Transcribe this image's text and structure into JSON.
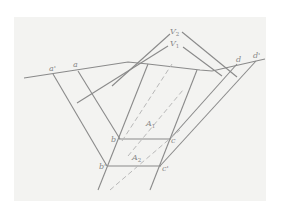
{
  "diagram": {
    "type": "geometric-construction",
    "labels": {
      "a_prime": "a'",
      "a": "a",
      "d": "d",
      "d_prime": "d'",
      "b": "b",
      "c": "c",
      "b_prime": "b'",
      "c_prime": "c'",
      "V1": "V",
      "V1_sub": "1",
      "V2": "V",
      "V2_sub": "2",
      "A1": "A",
      "A1_sub": "1",
      "A2": "A",
      "A2_sub": "2"
    },
    "colors": {
      "background": "#f3f3f1",
      "line": "#8a8a8a",
      "dashed": "#b8b8b8",
      "text": "#888888"
    }
  }
}
